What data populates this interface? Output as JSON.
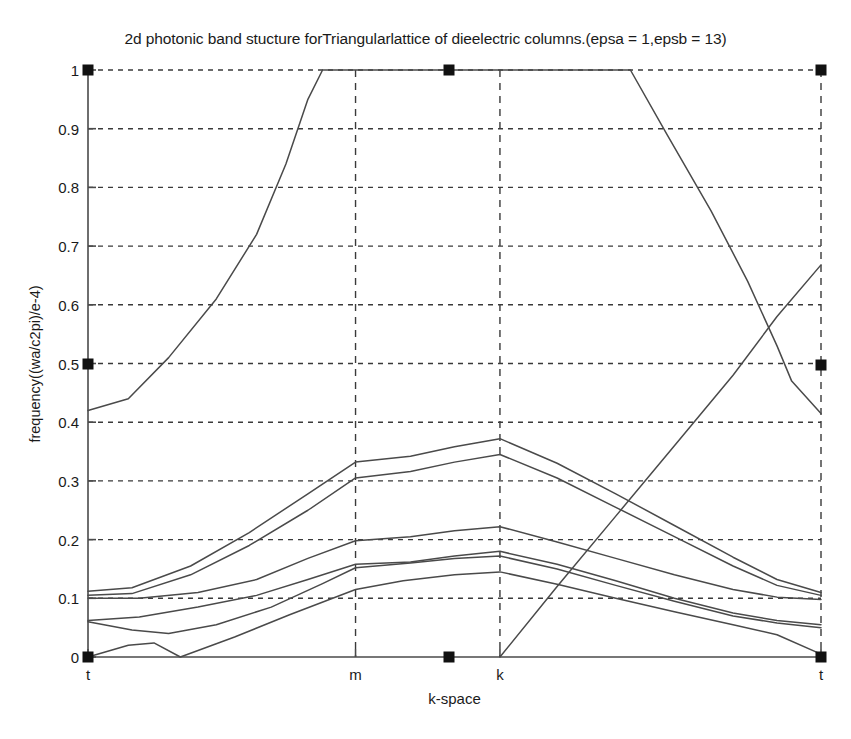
{
  "figure": {
    "title": "2d photonic band stucture forTriangularlattice of dieelectric columns.(epsa = 1,epsb = 13)",
    "background_color": "#ffffff",
    "line_color": "#4a4a4a",
    "axis_color": "#4a4a4a",
    "grid_color": "#3a3a3a",
    "marker_color": "#111111"
  },
  "chart_data": {
    "type": "line",
    "title": "2d photonic band stucture forTriangularlattice of dieelectric columns.(epsa = 1,epsb = 13)",
    "xlabel": "k-space",
    "ylabel": "frequency((wa/c2pi)/e-4)",
    "grid": true,
    "legend": "none",
    "xlim": [
      0,
      1
    ],
    "ylim": [
      0,
      1
    ],
    "ytick_labels": [
      "0",
      "0.1",
      "0.2",
      "0.3",
      "0.4",
      "0.5",
      "0.6",
      "0.7",
      "0.8",
      "0.9",
      "1"
    ],
    "ytick_values": [
      0,
      0.1,
      0.2,
      0.3,
      0.4,
      0.5,
      0.6,
      0.7,
      0.8,
      0.9,
      1
    ],
    "xtick_labels": [
      "t",
      "m",
      "k",
      "t"
    ],
    "xtick_values": [
      0,
      0.365,
      0.562,
      1
    ],
    "symmetry_points": {
      "t_left": 0.0,
      "m": 0.365,
      "k": 0.562,
      "t_right": 1.0
    },
    "series": [
      {
        "name": "band-1",
        "points": [
          [
            0.0,
            0.0
          ],
          [
            0.055,
            0.02
          ],
          [
            0.09,
            0.024
          ],
          [
            0.126,
            0.0
          ],
          [
            0.2,
            0.034
          ],
          [
            0.275,
            0.072
          ],
          [
            0.365,
            0.115
          ],
          [
            0.43,
            0.13
          ],
          [
            0.5,
            0.14
          ],
          [
            0.562,
            0.145
          ],
          [
            0.64,
            0.124
          ],
          [
            0.72,
            0.1
          ],
          [
            0.8,
            0.077
          ],
          [
            0.88,
            0.055
          ],
          [
            0.94,
            0.038
          ],
          [
            1.0,
            0.005
          ]
        ]
      },
      {
        "name": "band-2",
        "points": [
          [
            0.0,
            0.06
          ],
          [
            0.06,
            0.046
          ],
          [
            0.11,
            0.04
          ],
          [
            0.175,
            0.055
          ],
          [
            0.25,
            0.085
          ],
          [
            0.32,
            0.125
          ],
          [
            0.365,
            0.152
          ],
          [
            0.44,
            0.16
          ],
          [
            0.5,
            0.168
          ],
          [
            0.562,
            0.172
          ],
          [
            0.64,
            0.15
          ],
          [
            0.72,
            0.122
          ],
          [
            0.8,
            0.095
          ],
          [
            0.88,
            0.07
          ],
          [
            0.94,
            0.058
          ],
          [
            1.0,
            0.05
          ]
        ]
      },
      {
        "name": "band-3",
        "points": [
          [
            0.0,
            0.062
          ],
          [
            0.07,
            0.068
          ],
          [
            0.15,
            0.085
          ],
          [
            0.23,
            0.105
          ],
          [
            0.3,
            0.132
          ],
          [
            0.365,
            0.158
          ],
          [
            0.44,
            0.162
          ],
          [
            0.5,
            0.172
          ],
          [
            0.562,
            0.18
          ],
          [
            0.64,
            0.158
          ],
          [
            0.72,
            0.13
          ],
          [
            0.8,
            0.1
          ],
          [
            0.88,
            0.075
          ],
          [
            0.94,
            0.062
          ],
          [
            1.0,
            0.055
          ]
        ]
      },
      {
        "name": "band-4",
        "points": [
          [
            0.0,
            0.1
          ],
          [
            0.07,
            0.1
          ],
          [
            0.15,
            0.11
          ],
          [
            0.23,
            0.132
          ],
          [
            0.3,
            0.168
          ],
          [
            0.365,
            0.198
          ],
          [
            0.44,
            0.205
          ],
          [
            0.5,
            0.215
          ],
          [
            0.562,
            0.222
          ],
          [
            0.64,
            0.196
          ],
          [
            0.72,
            0.168
          ],
          [
            0.8,
            0.14
          ],
          [
            0.88,
            0.115
          ],
          [
            0.94,
            0.102
          ],
          [
            1.0,
            0.098
          ]
        ]
      },
      {
        "name": "band-5",
        "points": [
          [
            0.0,
            0.105
          ],
          [
            0.06,
            0.108
          ],
          [
            0.14,
            0.14
          ],
          [
            0.22,
            0.19
          ],
          [
            0.3,
            0.25
          ],
          [
            0.365,
            0.305
          ],
          [
            0.44,
            0.316
          ],
          [
            0.5,
            0.332
          ],
          [
            0.562,
            0.345
          ],
          [
            0.64,
            0.305
          ],
          [
            0.72,
            0.255
          ],
          [
            0.8,
            0.205
          ],
          [
            0.88,
            0.155
          ],
          [
            0.94,
            0.122
          ],
          [
            1.0,
            0.105
          ]
        ]
      },
      {
        "name": "band-6",
        "points": [
          [
            0.0,
            0.112
          ],
          [
            0.06,
            0.118
          ],
          [
            0.14,
            0.155
          ],
          [
            0.22,
            0.212
          ],
          [
            0.3,
            0.278
          ],
          [
            0.365,
            0.332
          ],
          [
            0.44,
            0.342
          ],
          [
            0.5,
            0.358
          ],
          [
            0.562,
            0.372
          ],
          [
            0.64,
            0.33
          ],
          [
            0.72,
            0.278
          ],
          [
            0.8,
            0.224
          ],
          [
            0.88,
            0.17
          ],
          [
            0.94,
            0.132
          ],
          [
            1.0,
            0.11
          ]
        ]
      },
      {
        "name": "band-7",
        "points": [
          [
            0.0,
            0.42
          ],
          [
            0.055,
            0.44
          ],
          [
            0.11,
            0.51
          ],
          [
            0.175,
            0.61
          ],
          [
            0.23,
            0.72
          ],
          [
            0.27,
            0.84
          ],
          [
            0.3,
            0.95
          ],
          [
            0.32,
            1.0
          ],
          [
            0.365,
            1.0
          ],
          [
            0.562,
            1.0
          ],
          [
            0.74,
            1.0
          ],
          [
            0.79,
            0.89
          ],
          [
            0.85,
            0.76
          ],
          [
            0.9,
            0.64
          ],
          [
            0.94,
            0.53
          ],
          [
            0.96,
            0.47
          ],
          [
            1.0,
            0.415
          ]
        ]
      },
      {
        "name": "band-8",
        "points": [
          [
            0.562,
            0.0
          ],
          [
            0.64,
            0.12
          ],
          [
            0.72,
            0.24
          ],
          [
            0.8,
            0.36
          ],
          [
            0.88,
            0.48
          ],
          [
            0.94,
            0.58
          ],
          [
            1.0,
            0.668
          ]
        ]
      }
    ],
    "markers": [
      {
        "name": "marker-top-left",
        "x": 0.0,
        "y": 1.0
      },
      {
        "name": "marker-top-mid",
        "x": 0.492,
        "y": 1.0
      },
      {
        "name": "marker-top-right",
        "x": 1.0,
        "y": 1.0
      },
      {
        "name": "marker-left-half",
        "x": 0.0,
        "y": 0.5
      },
      {
        "name": "marker-right-half",
        "x": 1.0,
        "y": 0.497
      },
      {
        "name": "marker-bottom-left",
        "x": 0.0,
        "y": 0.0
      },
      {
        "name": "marker-bottom-mid",
        "x": 0.492,
        "y": 0.0
      },
      {
        "name": "marker-bottom-right",
        "x": 1.0,
        "y": 0.0
      }
    ]
  }
}
